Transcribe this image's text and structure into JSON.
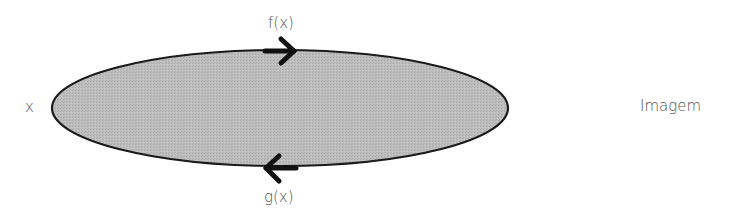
{
  "diagram": {
    "domain_label": "x",
    "codomain_label": "Imagem",
    "top_arrow_label": "f(x)",
    "bottom_arrow_label": "g(x)",
    "ellipse_fill": "#b8b8b8",
    "stroke_color": "#1a1a1a",
    "text_color": "#555555"
  }
}
